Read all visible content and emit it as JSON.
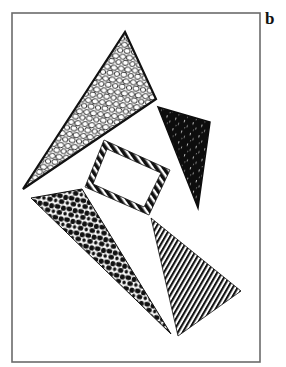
{
  "figure": {
    "panel_label": "b",
    "frame": {
      "x": 12,
      "y": 13,
      "width": 248,
      "height": 349,
      "stroke": "#6b6b6b",
      "stroke_width": 1.6
    },
    "ink_color": "#111111",
    "paper_color": "#ffffff",
    "shapes": [
      {
        "id": "cobblestone-triangle",
        "pattern": "cobblestone",
        "description": "Large triangle filled with an outlined cobblestone/pebble texture",
        "points": [
          [
            125,
            32
          ],
          [
            156,
            99
          ],
          [
            23,
            189
          ]
        ]
      },
      {
        "id": "solid-black-triangle",
        "pattern": "solid-speckled",
        "description": "Small triangle, solid black with faint white speckles",
        "points": [
          [
            158,
            107
          ],
          [
            210,
            122
          ],
          [
            198,
            208
          ]
        ]
      },
      {
        "id": "striped-rectangle-frame",
        "pattern": "barber-stripe",
        "description": "Tilted rectangular outline drawn with a diagonal barber-pole stripe border",
        "outer": [
          [
            104,
            140
          ],
          [
            170,
            170
          ],
          [
            149,
            215
          ],
          [
            85,
            187
          ]
        ],
        "inner": [
          [
            107,
            149
          ],
          [
            161,
            173
          ],
          [
            144,
            207
          ],
          [
            93,
            184
          ]
        ]
      },
      {
        "id": "leopard-triangle",
        "pattern": "leopard-spots",
        "description": "Long triangle filled with dense black rounded spots on white",
        "points": [
          [
            31,
            198
          ],
          [
            82,
            189
          ],
          [
            171,
            334
          ]
        ]
      },
      {
        "id": "striped-triangle",
        "pattern": "diagonal-lines",
        "description": "Triangle filled with fine diagonal hatching lines",
        "points": [
          [
            151,
            218
          ],
          [
            241,
            291
          ],
          [
            178,
            336
          ]
        ]
      }
    ]
  }
}
